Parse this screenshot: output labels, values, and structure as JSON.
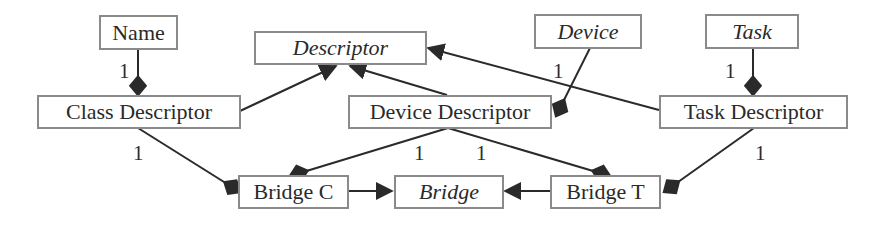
{
  "diagram": {
    "type": "uml-class-diagram",
    "colors": {
      "line": "#2a2a2a",
      "box_border": "#8a8a8a",
      "text": "#2a2a2a",
      "background": "#ffffff"
    },
    "nodes": [
      {
        "id": "name",
        "label": "Name",
        "abstract": false
      },
      {
        "id": "descriptor",
        "label": "Descriptor",
        "abstract": true
      },
      {
        "id": "device",
        "label": "Device",
        "abstract": true
      },
      {
        "id": "task",
        "label": "Task",
        "abstract": true
      },
      {
        "id": "class_descriptor",
        "label": "Class Descriptor",
        "abstract": false
      },
      {
        "id": "device_descriptor",
        "label": "Device Descriptor",
        "abstract": false
      },
      {
        "id": "task_descriptor",
        "label": "Task Descriptor",
        "abstract": false
      },
      {
        "id": "bridge_c",
        "label": "Bridge C",
        "abstract": false
      },
      {
        "id": "bridge",
        "label": "Bridge",
        "abstract": true
      },
      {
        "id": "bridge_t",
        "label": "Bridge T",
        "abstract": false
      }
    ],
    "edges": [
      {
        "from": "class_descriptor",
        "to": "name",
        "kind": "composition",
        "multiplicity": "1"
      },
      {
        "from": "task_descriptor",
        "to": "task",
        "kind": "composition",
        "multiplicity": "1"
      },
      {
        "from": "device_descriptor",
        "to": "device",
        "kind": "composition",
        "multiplicity": "1"
      },
      {
        "from": "class_descriptor",
        "to": "descriptor",
        "kind": "generalization"
      },
      {
        "from": "device_descriptor",
        "to": "descriptor",
        "kind": "generalization"
      },
      {
        "from": "task_descriptor",
        "to": "descriptor",
        "kind": "generalization"
      },
      {
        "from": "bridge_c",
        "to": "class_descriptor",
        "kind": "composition",
        "multiplicity": "1"
      },
      {
        "from": "bridge_c",
        "to": "device_descriptor",
        "kind": "composition",
        "multiplicity": "1"
      },
      {
        "from": "bridge_t",
        "to": "device_descriptor",
        "kind": "composition",
        "multiplicity": "1"
      },
      {
        "from": "bridge_t",
        "to": "task_descriptor",
        "kind": "composition",
        "multiplicity": "1"
      },
      {
        "from": "bridge_c",
        "to": "bridge",
        "kind": "generalization"
      },
      {
        "from": "bridge_t",
        "to": "bridge",
        "kind": "generalization"
      }
    ],
    "multiplicity_labels": {
      "name_class": "1",
      "device_devdesc": "1",
      "task_taskdesc": "1",
      "class_bridgec": "1",
      "devdesc_bridgec": "1",
      "devdesc_bridget": "1",
      "taskdesc_bridget": "1"
    }
  }
}
